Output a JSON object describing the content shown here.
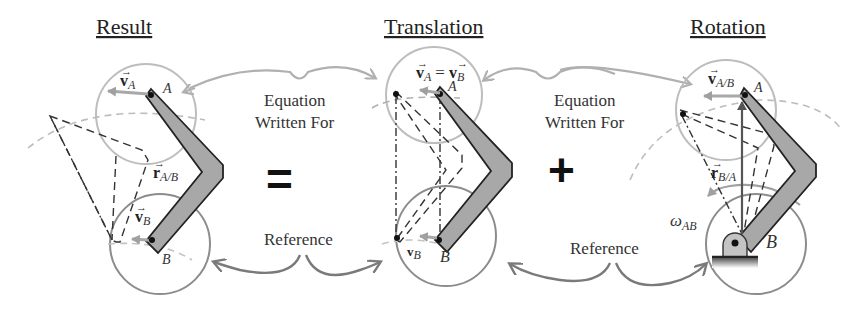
{
  "titles": {
    "result": "Result",
    "translation": "Translation",
    "rotation": "Rotation"
  },
  "operators": {
    "equals": "=",
    "plus": "+"
  },
  "connector_labels": {
    "left_top_line1": "Equation",
    "left_top_line2": "Written For",
    "right_top_line1": "Equation",
    "right_top_line2": "Written For",
    "left_bottom": "Reference",
    "right_bottom": "Reference"
  },
  "result_panel": {
    "v_A": "v",
    "v_A_sub": "A",
    "point_A": "A",
    "r_AB": "r",
    "r_AB_sub": "A/B",
    "v_B": "v",
    "v_B_sub": "B",
    "point_B": "B"
  },
  "translation_panel": {
    "eq_left": "v",
    "eq_left_sub": "A",
    "eq_sign": "=",
    "eq_right": "v",
    "eq_right_sub": "B",
    "point_A": "A",
    "v_B": "v",
    "v_B_sub": "B",
    "point_B": "B"
  },
  "rotation_panel": {
    "v_AB": "v",
    "v_AB_sub": "A/B",
    "point_A": "A",
    "r_BA": "r",
    "r_BA_sub": "B/A",
    "omega": "ω",
    "omega_sub": "AB",
    "point_B": "B"
  },
  "colors": {
    "link_fill": "#a8a8a8",
    "link_stroke": "#222222",
    "circle_light": "#b8b8b8",
    "circle_dark": "#8a8a8a",
    "arrow_light": "#b0b0b0",
    "arrow_dark": "#7a7a7a",
    "dashed": "#333333"
  }
}
